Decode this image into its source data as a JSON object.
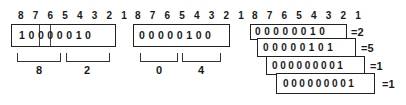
{
  "panels": [
    {
      "bit_positions": "8 7 6 5 4 3 2 1",
      "digits": [
        "1",
        "0",
        "0",
        "0",
        "0",
        "0",
        "1",
        "0"
      ],
      "digits_text": "10000010",
      "groups": [
        {
          "label": "8",
          "bits": "8-5"
        },
        {
          "label": "2",
          "bits": "4-1"
        }
      ]
    },
    {
      "bit_positions": "8 7 6 5 4 3 2 1",
      "digits_text": "00000100",
      "groups": [
        {
          "label": "0",
          "bits": "8-5"
        },
        {
          "label": "4",
          "bits": "4-1"
        }
      ]
    },
    {
      "bit_positions": "8 7 6 5 4 3 2 1",
      "rows": [
        {
          "digits_text": "00000010",
          "value": "=2"
        },
        {
          "digits_text": "00000101",
          "value": "=5"
        },
        {
          "digits_text": "000000001",
          "value": "=1"
        },
        {
          "digits_text": "000000001",
          "value": "=1"
        }
      ]
    }
  ],
  "colors": {
    "line": "#222222",
    "text": "#1a1a1a",
    "background": "#ffffff"
  }
}
